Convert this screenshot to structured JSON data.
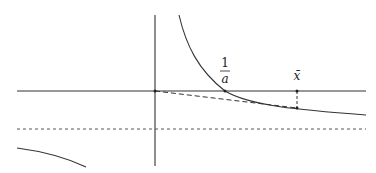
{
  "diagram": {
    "labels": {
      "one_over_a_num": "1",
      "one_over_a_den": "a",
      "x_bar": "x̄"
    },
    "colors": {
      "stroke": "#333333",
      "background": "#ffffff"
    },
    "elements": [
      "vertical-axis",
      "horizontal-axis",
      "dotted-asymptote",
      "hyperbola-right-branch",
      "hyperbola-left-branch",
      "dashed-secant-line",
      "dashed-vertical-marker"
    ]
  }
}
